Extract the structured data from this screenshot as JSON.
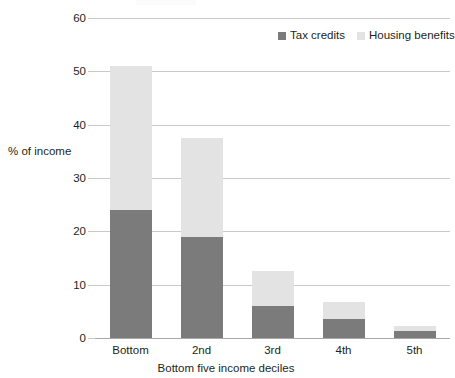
{
  "chart_data": {
    "type": "bar",
    "stacked": true,
    "title": "",
    "xlabel": "Bottom five income deciles",
    "ylabel": "% of income",
    "categories": [
      "Bottom",
      "2nd",
      "3rd",
      "4th",
      "5th"
    ],
    "series": [
      {
        "name": "Tax credits",
        "color": "#7b7b7b",
        "values": [
          24,
          19,
          6,
          3.5,
          1.3
        ]
      },
      {
        "name": "Housing benefits",
        "color": "#e3e3e3",
        "values": [
          27,
          18.5,
          6.5,
          3.2,
          1.0
        ]
      }
    ],
    "totals": [
      51,
      37.5,
      12.5,
      6.7,
      2.3
    ],
    "ylim": [
      0,
      60
    ],
    "yticks": [
      0,
      10,
      20,
      30,
      40,
      50,
      60
    ],
    "ytick_labels": [
      "0",
      "10",
      "20",
      "30",
      "40",
      "50",
      "60"
    ],
    "grid": "horizontal",
    "legend_position": "top-right"
  },
  "axes": {
    "y_title": "% of income",
    "x_title": "Bottom five income deciles"
  },
  "legend": {
    "entries": [
      {
        "label": "Tax credits",
        "color": "#7b7b7b"
      },
      {
        "label": "Housing benefits",
        "color": "#e3e3e3"
      }
    ]
  }
}
